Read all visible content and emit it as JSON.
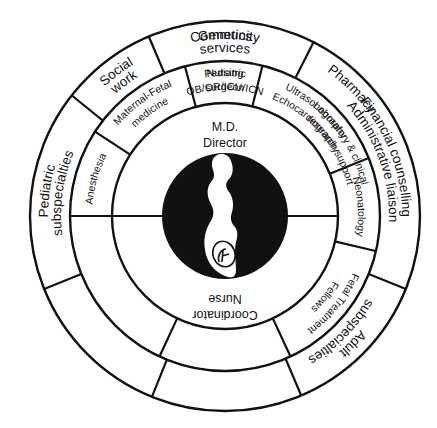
{
  "diagram": {
    "type": "concentric-ring-organization-chart",
    "center_icon": "pregnant-woman-silhouette-icon",
    "colors": {
      "ink": "#111111",
      "background": "#ffffff",
      "center_fill": "#111111"
    },
    "outer_ring": [
      {
        "id": "community",
        "lines": [
          "Community",
          "services"
        ]
      },
      {
        "id": "financial",
        "lines": [
          "Financial counselling",
          "Administrative liaison"
        ]
      },
      {
        "id": "adult",
        "lines": [
          "Adult",
          "subspecialties"
        ]
      },
      {
        "id": "genetics",
        "lines": [
          "Genetics"
        ]
      },
      {
        "id": "pharmacy",
        "lines": [
          "Pharmacy"
        ]
      },
      {
        "id": "pediatric-sub",
        "lines": [
          "Pediatric",
          "subspecialties"
        ]
      },
      {
        "id": "social",
        "lines": [
          "Social",
          "work"
        ]
      }
    ],
    "middle_ring": [
      {
        "id": "ped-surgeon",
        "lines": [
          "Pediatric",
          "surgeon"
        ]
      },
      {
        "id": "ultrasound",
        "lines": [
          "Ultrasonography",
          "Echocardiography"
        ]
      },
      {
        "id": "neonatology",
        "lines": [
          "Neonatology"
        ]
      },
      {
        "id": "fetal",
        "lines": [
          "Fetal Treatment",
          "Fellows"
        ]
      },
      {
        "id": "nursing",
        "lines": [
          "OB/OR/ICU/ICN",
          "Nursing"
        ]
      },
      {
        "id": "lab",
        "lines": [
          "Laboratory & clinical",
          "research support"
        ]
      },
      {
        "id": "anesthesia",
        "lines": [
          "Anesthesia"
        ]
      },
      {
        "id": "mfm",
        "lines": [
          "Maternal-Fetal",
          "medicine"
        ]
      }
    ],
    "inner": {
      "top": [
        "M.D.",
        "Director"
      ],
      "bottom": [
        "Nurse",
        "Coordinator"
      ]
    }
  }
}
